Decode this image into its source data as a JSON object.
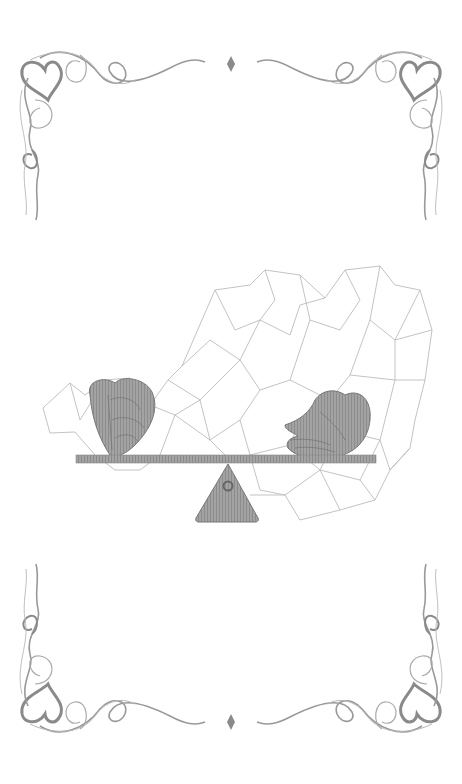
{
  "illustration": {
    "title": "Balance of heart and hand",
    "background_color": "#ffffff",
    "ornament_color": "#8a8a8a",
    "mesh_color": "#b4b4b4",
    "fill_color": "#9a9a9a",
    "elements": {
      "top_diamond": "diamond-ornament",
      "bottom_diamond": "diamond-ornament",
      "corners": [
        "swirl-heart-top-left",
        "swirl-heart-top-right",
        "swirl-heart-bottom-left",
        "swirl-heart-bottom-right"
      ],
      "center": [
        "polygon-mesh",
        "seesaw-beam",
        "seesaw-fulcrum",
        "heart-fist",
        "open-hand"
      ]
    }
  }
}
